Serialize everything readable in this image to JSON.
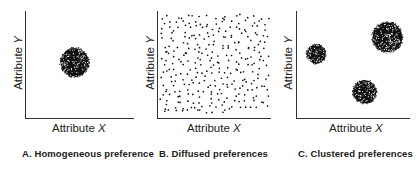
{
  "figure": {
    "panels": [
      {
        "id": "A",
        "caption": "A. Homogeneous preference",
        "xlabel_text": "Attribute ",
        "xlabel_var": "X",
        "ylabel_text": "Attribute ",
        "ylabel_var": "Y"
      },
      {
        "id": "B",
        "caption": "B. Diffused preferences",
        "xlabel_text": "Attribute ",
        "xlabel_var": "X",
        "ylabel_text": "Attribute ",
        "ylabel_var": "Y"
      },
      {
        "id": "C",
        "caption": "C. Clustered preferences",
        "xlabel_text": "Attribute ",
        "xlabel_var": "X",
        "ylabel_text": "Attribute ",
        "ylabel_var": "Y"
      }
    ],
    "colors": {
      "ink": "#111111",
      "axis": "#333333",
      "background": "#ffffff"
    }
  },
  "chart_data": [
    {
      "type": "scatter",
      "title": "A. Homogeneous preference",
      "xlabel": "Attribute X",
      "ylabel": "Attribute Y",
      "grid": false,
      "description": "Single dense cluster near the center of the attribute space",
      "clusters": [
        {
          "cx": 0.45,
          "cy": 0.52,
          "r": 0.14
        }
      ]
    },
    {
      "type": "scatter",
      "title": "B. Diffused preferences",
      "xlabel": "Attribute X",
      "ylabel": "Attribute Y",
      "grid": false,
      "description": "Points spread uniformly across the whole attribute space",
      "uniform_points": 300
    },
    {
      "type": "scatter",
      "title": "C. Clustered preferences",
      "xlabel": "Attribute X",
      "ylabel": "Attribute Y",
      "grid": false,
      "description": "Three distinct preference clusters",
      "clusters": [
        {
          "cx": 0.17,
          "cy": 0.6,
          "r": 0.09
        },
        {
          "cx": 0.8,
          "cy": 0.76,
          "r": 0.14
        },
        {
          "cx": 0.6,
          "cy": 0.24,
          "r": 0.11
        }
      ]
    }
  ]
}
